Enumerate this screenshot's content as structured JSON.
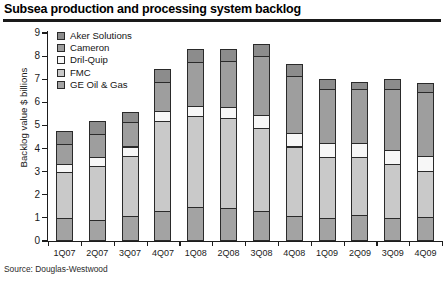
{
  "title": "Subsea production and processing system backlog",
  "source": "Source: Douglas-Westwood",
  "legend": [
    {
      "label": "Aker Solutions",
      "color": "#8c8c8c",
      "swatch_icon": "legend-swatch-icon"
    },
    {
      "label": "Cameron",
      "color": "#9e9e9e",
      "swatch_icon": "legend-swatch-icon"
    },
    {
      "label": "Dril-Quip",
      "color": "#f7f7f7",
      "swatch_icon": "legend-swatch-icon"
    },
    {
      "label": "FMC",
      "color": "#c9c9c9",
      "swatch_icon": "legend-swatch-icon"
    },
    {
      "label": "GE Oil & Gas",
      "color": "#a3a3a3",
      "swatch_icon": "legend-swatch-icon"
    }
  ],
  "chart_data": {
    "type": "bar",
    "stacked": true,
    "title": "Subsea production and processing system backlog",
    "xlabel": "",
    "ylabel": "Backlog value $ billions",
    "ylim": [
      0,
      9
    ],
    "ytick_step": 1,
    "yticks": [
      "0",
      "1",
      "2",
      "3",
      "4",
      "5",
      "6",
      "7",
      "8",
      "9"
    ],
    "grid": false,
    "legend_position": "top-left",
    "categories": [
      "1Q07",
      "2Q07",
      "3Q07",
      "4Q07",
      "1Q08",
      "2Q08",
      "3Q08",
      "4Q08",
      "1Q09",
      "2Q09",
      "3Q09",
      "4Q09"
    ],
    "stack_order_bottom_to_top": [
      "GE Oil & Gas",
      "FMC",
      "Dril-Quip",
      "Cameron",
      "Aker Solutions"
    ],
    "series": [
      {
        "name": "GE Oil & Gas",
        "color": "#a3a3a3",
        "values": [
          0.95,
          0.85,
          1.05,
          1.25,
          1.45,
          1.4,
          1.25,
          1.05,
          0.95,
          1.1,
          0.95,
          1.0
        ]
      },
      {
        "name": "FMC",
        "color": "#c9c9c9",
        "values": [
          2.0,
          2.35,
          2.6,
          3.9,
          3.9,
          3.9,
          3.6,
          3.0,
          2.65,
          2.5,
          2.35,
          2.0
        ]
      },
      {
        "name": "Dril-Quip",
        "color": "#f7f7f7",
        "values": [
          0.35,
          0.4,
          0.4,
          0.45,
          0.45,
          0.45,
          0.55,
          0.6,
          0.6,
          0.6,
          0.6,
          0.65
        ]
      },
      {
        "name": "Cameron",
        "color": "#9e9e9e",
        "values": [
          0.85,
          1.0,
          1.05,
          1.25,
          1.9,
          2.0,
          2.55,
          2.45,
          2.35,
          2.35,
          2.65,
          2.75
        ]
      },
      {
        "name": "Aker Solutions",
        "color": "#8c8c8c",
        "values": [
          0.55,
          0.55,
          0.45,
          0.55,
          0.55,
          0.5,
          0.55,
          0.5,
          0.4,
          0.3,
          0.4,
          0.4
        ]
      }
    ],
    "totals": [
      4.7,
      5.15,
      5.55,
      7.4,
      8.25,
      8.25,
      8.5,
      7.6,
      6.95,
      6.85,
      6.95,
      6.8
    ]
  }
}
